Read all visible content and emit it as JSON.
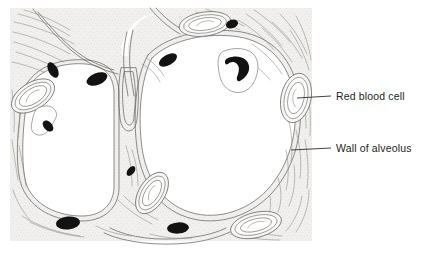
{
  "figure": {
    "type": "biological-diagram",
    "background_color": "#ffffff",
    "tissue_fill": "#f0efed",
    "tissue_stroke": "#6f6c68",
    "nucleus_color": "#111111",
    "lumen_color": "#ffffff"
  },
  "labels": [
    {
      "id": "red-blood-cell",
      "text": "Red blood cell",
      "leader": {
        "x1": 297,
        "y1": 98,
        "x2": 330,
        "y2": 96
      }
    },
    {
      "id": "wall-of-alveolus",
      "text": "Wall of alveolus",
      "leader": {
        "x1": 291,
        "y1": 150,
        "x2": 330,
        "y2": 148
      }
    }
  ],
  "structures": {
    "alveoli": [
      {
        "name": "upper-left-alveolus"
      },
      {
        "name": "lower-left-alveolus"
      },
      {
        "name": "large-right-alveolus"
      },
      {
        "name": "bottom-alveolus"
      }
    ],
    "capillaries_with_red_blood_cells": 6,
    "endothelial_nuclei": 10
  },
  "colors": {
    "text": "#231f20",
    "leader_line": "#231f20"
  }
}
